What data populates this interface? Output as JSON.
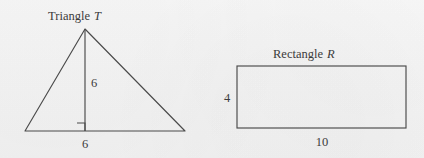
{
  "page": {
    "background_color": "#f4f4f4",
    "stroke_color": "#4a4a4a",
    "text_color": "#3b3b3b",
    "width": 424,
    "height": 158
  },
  "figures": {
    "triangle": {
      "title_word": "Triangle",
      "title_variable": "T",
      "height_label": "6",
      "base_label": "6",
      "apex": {
        "x": 85,
        "y": 29
      },
      "left_vertex": {
        "x": 25,
        "y": 131
      },
      "right_vertex": {
        "x": 185,
        "y": 131
      },
      "foot_of_altitude": {
        "x": 85,
        "y": 131
      },
      "right_angle_marker_size": 8,
      "title_position": {
        "x": 90,
        "y": 20
      },
      "height_label_position": {
        "x": 91,
        "y": 87
      },
      "base_label_position": {
        "x": 85,
        "y": 148
      }
    },
    "rectangle": {
      "title_word": "Rectangle",
      "title_variable": "R",
      "height_label": "4",
      "width_label": "10",
      "left": 237,
      "top": 66,
      "right": 406,
      "bottom": 128,
      "title_position": {
        "x": 322,
        "y": 58
      },
      "height_label_position": {
        "x": 227,
        "y": 102
      },
      "width_label_position": {
        "x": 322,
        "y": 146
      }
    }
  },
  "chart_data": {
    "type": "diagram",
    "shapes": [
      {
        "name": "Triangle T",
        "kind": "triangle",
        "labels": {
          "base": 6,
          "height": 6
        },
        "has_right_angle_marker": true,
        "area": 18,
        "vertices_px": [
          [
            25,
            131
          ],
          [
            185,
            131
          ],
          [
            85,
            29
          ]
        ]
      },
      {
        "name": "Rectangle R",
        "kind": "rectangle",
        "labels": {
          "width": 10,
          "height": 4
        },
        "area": 40,
        "bounds_px": {
          "x": 237,
          "y": 66,
          "width": 169,
          "height": 62
        }
      }
    ]
  }
}
